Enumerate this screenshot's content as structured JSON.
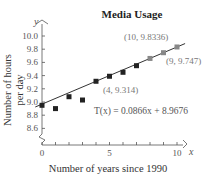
{
  "chart_data": {
    "type": "scatter",
    "title": "Media Usage",
    "xlabel": "Number of years since 1990",
    "ylabel": "Number of hours per day",
    "x_var": "x",
    "y_var": "y",
    "xlim": [
      0,
      10
    ],
    "ylim": [
      8.6,
      10.0
    ],
    "x_ticks": [
      0,
      1,
      2,
      3,
      4,
      5,
      6,
      7,
      8,
      9,
      10
    ],
    "x_tick_labels": [
      "0",
      "5",
      "10"
    ],
    "y_ticks": [
      8.6,
      8.8,
      9.0,
      9.2,
      9.4,
      9.6,
      9.8,
      10.0
    ],
    "y_tick_labels": [
      "8.6",
      "8.8",
      "9.0",
      "9.2",
      "9.4",
      "9.6",
      "9.8",
      "10.0"
    ],
    "y_axis_break": true,
    "grid": false,
    "series": [
      {
        "name": "Data",
        "x": [
          0,
          1,
          2,
          3,
          4,
          5,
          6,
          7,
          8,
          9,
          10
        ],
        "values": [
          8.95,
          8.9,
          9.08,
          9.03,
          9.314,
          9.39,
          9.45,
          9.55,
          9.66,
          9.747,
          9.8336
        ]
      }
    ],
    "regression": {
      "label": "T(x) = 0.0866x + 8.9676",
      "slope": 0.0866,
      "intercept": 8.9676
    },
    "annotations": [
      {
        "text": "(10, 9.8336)",
        "x": 10,
        "y": 9.8336
      },
      {
        "text": "(9, 9.747)",
        "x": 9,
        "y": 9.747
      },
      {
        "text": "(4, 9.314)",
        "x": 4,
        "y": 9.314
      }
    ]
  },
  "labels": {
    "title": "Media Usage",
    "xlabel": "Number of years since 1990",
    "ylabel_line1": "Number of hours",
    "ylabel_line2": "per day",
    "x_var": "x",
    "y_var": "y",
    "equation": "T(x) = 0.0866x + 8.9676",
    "annot_10": "(10, 9.8336)",
    "annot_9": "(9, 9.747)",
    "annot_4": "(4, 9.314)"
  },
  "colors": {
    "point_dark": "#222222",
    "point_light": "#888888",
    "line": "#333333",
    "axis": "#555555"
  }
}
